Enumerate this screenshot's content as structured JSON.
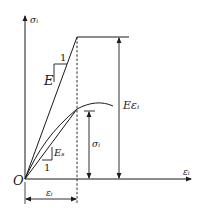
{
  "diagram": {
    "colors": {
      "line": "#1a1a1a",
      "background": "#ffffff"
    },
    "axes": {
      "y_label": "σᵢ",
      "x_label": "εᵢ",
      "origin_label": "O"
    },
    "elastic_line": {
      "slope_label": "E",
      "unit_label": "1"
    },
    "secant_line": {
      "slope_label": "Eₛ",
      "unit_label": "1"
    },
    "dimensions": {
      "elastic_stress": "Eεᵢ",
      "actual_stress": "σᵢ",
      "strain": "εᵢ"
    }
  }
}
